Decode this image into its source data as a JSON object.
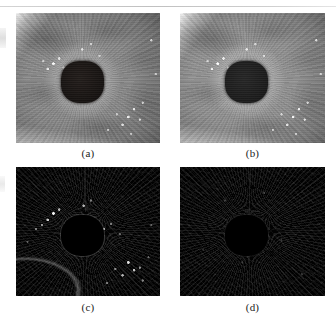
{
  "figure": {
    "kind": "image-grid",
    "rows": 2,
    "columns": 2,
    "background_color": "#ffffff",
    "panels": [
      {
        "id": "a",
        "caption": "(a)",
        "subject": "iris",
        "modality": "grayscale-eye-image",
        "description": "Grayscale close-up of a human iris with a dark rounded-square pupil slightly left of centre, radial fibre texture, bright specular speckles upper-left of the pupil and along the lower-right, and a bright sclera wedge at the upper-left corner.",
        "tone": "mid-gray",
        "pupil_position": "left-of-centre",
        "dominant_gray": "#8a8a8a",
        "pupil_gray": "#1d1917"
      },
      {
        "id": "b",
        "caption": "(b)",
        "subject": "iris",
        "modality": "grayscale-eye-image",
        "description": "Near-identical grayscale iris close-up, marginally brighter and smoother than (a), with the same dark rounded-square pupil and specular speckle clusters.",
        "tone": "mid-gray-brighter",
        "pupil_position": "left-of-centre",
        "dominant_gray": "#909090",
        "pupil_gray": "#1d1917"
      },
      {
        "id": "c",
        "caption": "(c)",
        "subject": "iris-residual",
        "modality": "difference-map",
        "description": "Very dark residual/difference map of the iris. Fine edge texture is faintly visible; bright white speckles cluster upper-left of the pupil and across the lower-right quadrant. The pupil appears as a black rounded-square hole outlined by a thin gray rim, and a faint limbus arc crosses the lower-left corner.",
        "tone": "near-black-with-bright-speckles",
        "pupil_position": "left-of-centre",
        "dominant_gray": "#0b0b0b",
        "pupil_gray": "#000000"
      },
      {
        "id": "d",
        "caption": "(d)",
        "subject": "iris-residual",
        "modality": "difference-map",
        "description": "Residual/difference map noticeably darker and cleaner than (c), with only faint low-contrast edge noise and almost no bright speckles. The pupil is a barely distinguishable black rounded-square region.",
        "tone": "near-black-uniform",
        "pupil_position": "left-of-centre",
        "dominant_gray": "#070707",
        "pupil_gray": "#000000"
      }
    ]
  },
  "page": {
    "top_rule_color": "#bfbfbf",
    "has_top_rule": true,
    "edge_artifacts": "faint gray scan smudges along the left margin"
  }
}
